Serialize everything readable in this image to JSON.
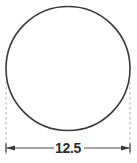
{
  "drawing": {
    "type": "engineering-dimension-drawing",
    "title": "Circle with horizontal diameter dimension",
    "background_color": "#ffffff",
    "canvas": {
      "width": 137,
      "height": 163
    },
    "shape": {
      "kind": "circle",
      "center_x": 68,
      "center_y": 68.5,
      "radius": 62,
      "stroke_color": "#3a3a3a",
      "stroke_width": 1.6,
      "fill": "none",
      "clipped_at_top": true
    },
    "dimension": {
      "label": "12.5",
      "label_color": "#2b2b2b",
      "measures": "diameter",
      "orientation": "horizontal",
      "line_y": 148,
      "line_color": "#4a4a4a",
      "left_x": 6,
      "right_x": 130,
      "arrow_style": "filled-triangle-outward",
      "text_center_x": 68,
      "text_baseline_y": 153
    },
    "extension_lines": {
      "style": "dashed",
      "color": "#b0b0b0",
      "stroke_width": 1,
      "dash_pattern": "2.5 2.5",
      "top_y": 82,
      "bottom_y": 156,
      "left_x": 6,
      "right_x": 130
    }
  }
}
